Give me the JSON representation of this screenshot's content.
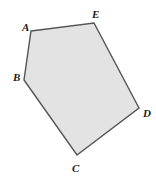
{
  "figure": {
    "name": "labeled-pentagon",
    "width": 156,
    "height": 179,
    "background_color": "#ffffff",
    "shape": {
      "type": "pentagon",
      "fill_color": "#e3e3e3",
      "stroke_color": "#555555",
      "stroke_width": 1.4,
      "points": "31,31 94,23 139,108 77,155 24,80"
    },
    "vertices": [
      {
        "id": "A",
        "label": "A",
        "x": 31,
        "y": 31,
        "label_x": 22,
        "label_y": 31
      },
      {
        "id": "E",
        "label": "E",
        "x": 94,
        "y": 23,
        "label_x": 92,
        "label_y": 18
      },
      {
        "id": "D",
        "label": "D",
        "x": 139,
        "y": 108,
        "label_x": 143,
        "label_y": 117
      },
      {
        "id": "C",
        "label": "C",
        "x": 77,
        "y": 155,
        "label_x": 72,
        "label_y": 172
      },
      {
        "id": "B",
        "label": "B",
        "x": 24,
        "y": 80,
        "label_x": 13,
        "label_y": 81
      }
    ]
  }
}
